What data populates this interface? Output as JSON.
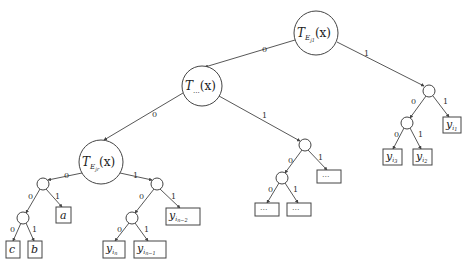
{
  "diagram": {
    "type": "binary-decision-tree",
    "nodes": {
      "root": {
        "label": "T",
        "sub": "E",
        "subsub": "j1",
        "arg": "(x)",
        "cx": 316,
        "cy": 33,
        "r": 22
      },
      "mid": {
        "label": "T",
        "sub": "...",
        "arg": "(x)",
        "cx": 202,
        "cy": 86,
        "r": 20
      },
      "left": {
        "label": "T",
        "sub": "E",
        "subsub": "jr",
        "arg": "(x)",
        "cx": 101,
        "cy": 162,
        "r": 22
      },
      "right_small": {
        "cx": 429,
        "cy": 91,
        "r": 6
      },
      "right_sub": {
        "cx": 407,
        "cy": 123,
        "r": 6
      },
      "mid_small": {
        "cx": 305,
        "cy": 145,
        "r": 6
      },
      "mid_sub": {
        "cx": 282,
        "cy": 178,
        "r": 6
      },
      "left_small_a": {
        "cx": 43,
        "cy": 184,
        "r": 6
      },
      "left_sub_a": {
        "cx": 23,
        "cy": 218,
        "r": 6
      },
      "left_small_b": {
        "cx": 157,
        "cy": 184,
        "r": 6
      },
      "left_sub_b": {
        "cx": 132,
        "cy": 218,
        "r": 6
      }
    },
    "leaves": [
      {
        "id": "y_i1",
        "text": "y",
        "sub": "i",
        "subsub": "1",
        "x": 443,
        "y": 117,
        "w": 18,
        "h": 16
      },
      {
        "id": "y_i3",
        "text": "y",
        "sub": "i",
        "subsub": "3",
        "x": 383,
        "y": 149,
        "w": 19,
        "h": 16
      },
      {
        "id": "y_i2",
        "text": "y",
        "sub": "i",
        "subsub": "2",
        "x": 413,
        "y": 149,
        "w": 19,
        "h": 16
      },
      {
        "id": "dots_r",
        "text": "···",
        "x": 317,
        "y": 170,
        "w": 24,
        "h": 13
      },
      {
        "id": "dots_l",
        "text": "···",
        "x": 255,
        "y": 203,
        "w": 24,
        "h": 13
      },
      {
        "id": "dots_m",
        "text": "···",
        "x": 287,
        "y": 203,
        "w": 24,
        "h": 13
      },
      {
        "id": "a",
        "text": "a",
        "x": 56,
        "y": 207,
        "w": 15,
        "h": 16
      },
      {
        "id": "c",
        "text": "c",
        "x": 6,
        "y": 241,
        "w": 14,
        "h": 17
      },
      {
        "id": "b",
        "text": "b",
        "x": 28,
        "y": 241,
        "w": 14,
        "h": 17
      },
      {
        "id": "y_in_2",
        "text": "y",
        "sub": "i",
        "subsub": "n−2",
        "x": 166,
        "y": 208,
        "w": 34,
        "h": 17
      },
      {
        "id": "y_in",
        "text": "y",
        "sub": "i",
        "subsub": "n",
        "x": 103,
        "y": 241,
        "w": 22,
        "h": 17
      },
      {
        "id": "y_in_1",
        "text": "y",
        "sub": "i",
        "subsub": "n−1",
        "x": 134,
        "y": 241,
        "w": 32,
        "h": 17
      }
    ],
    "edge_labels": {
      "zero": "0",
      "one": "1"
    }
  }
}
